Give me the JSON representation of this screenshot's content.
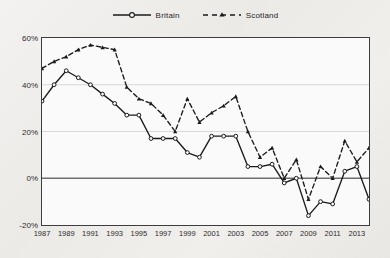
{
  "chart_data": {
    "type": "line",
    "title": "",
    "subtitle": "",
    "xlabel": "",
    "ylabel": "",
    "x": [
      1987,
      1988,
      1989,
      1990,
      1991,
      1992,
      1993,
      1994,
      1995,
      1996,
      1997,
      1998,
      1999,
      2000,
      2001,
      2002,
      2003,
      2004,
      2005,
      2006,
      2007,
      2008,
      2009,
      2010,
      2011,
      2012,
      2013,
      2014
    ],
    "xtick_labels": [
      "1987",
      "1989",
      "1991",
      "1993",
      "1995",
      "1997",
      "1999",
      "2001",
      "2003",
      "2005",
      "2007",
      "2009",
      "2011",
      "2013"
    ],
    "xtick_values": [
      1987,
      1989,
      1991,
      1993,
      1995,
      1997,
      1999,
      2001,
      2003,
      2005,
      2007,
      2009,
      2011,
      2013
    ],
    "ytick_labels": [
      "60%",
      "40%",
      "20%",
      "0%",
      "-20%"
    ],
    "ytick_values": [
      60,
      40,
      20,
      0,
      -20
    ],
    "ylim": [
      -20,
      60
    ],
    "xlim": [
      1987,
      2014
    ],
    "grid": "horizontal",
    "legend_position": "top-center",
    "series": [
      {
        "name": "Britain",
        "style": "solid",
        "marker": "circle",
        "color": "#1a1a1a",
        "values": [
          33,
          40,
          46,
          43,
          40,
          36,
          32,
          27,
          27,
          17,
          17,
          17,
          11,
          9,
          18,
          18,
          18,
          5,
          5,
          6,
          -2,
          0,
          -16,
          -10,
          -11,
          3,
          5,
          -9
        ]
      },
      {
        "name": "Scotland",
        "style": "dashed",
        "marker": "triangle",
        "color": "#1a1a1a",
        "values": [
          47,
          50,
          52,
          55,
          57,
          56,
          55,
          39,
          34,
          32,
          27,
          20,
          34,
          24,
          28,
          31,
          35,
          20,
          9,
          13,
          0,
          8,
          -9,
          5,
          0,
          16,
          7,
          13
        ]
      }
    ]
  },
  "legend": {
    "items": [
      {
        "label": "Britain"
      },
      {
        "label": "Scotland"
      }
    ]
  },
  "axes": {
    "zero_line_value": "0%"
  }
}
